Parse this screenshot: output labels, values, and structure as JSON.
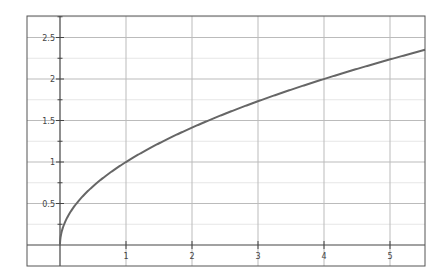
{
  "chart_data": {
    "type": "line",
    "title": "",
    "xlabel": "",
    "ylabel": "",
    "function": "y = sqrt(x)",
    "xlim": [
      -0.5,
      5.5
    ],
    "ylim": [
      -0.25,
      2.75
    ],
    "x_ticks": [
      1,
      2,
      3,
      4,
      5
    ],
    "x_tick_labels": [
      "1",
      "2",
      "3",
      "4",
      "5"
    ],
    "y_ticks": [
      0.5,
      1,
      1.5,
      2,
      2.5
    ],
    "y_tick_labels": [
      "0.5",
      "1",
      "1.5",
      "2",
      "2.5"
    ],
    "y_minor_step": 0.25,
    "grid": true,
    "series": [
      {
        "name": "sqrt(x)",
        "color": "#666666",
        "x": [
          0,
          0.01,
          0.05,
          0.1,
          0.25,
          0.5,
          1,
          1.5,
          2,
          2.5,
          3,
          3.5,
          4,
          4.5,
          5,
          5.5
        ],
        "y": [
          0,
          0.1,
          0.224,
          0.316,
          0.5,
          0.707,
          1,
          1.225,
          1.414,
          1.581,
          1.732,
          1.871,
          2,
          2.121,
          2.236,
          2.345
        ]
      }
    ]
  },
  "colors": {
    "frame": "#555555",
    "axis": "#444444",
    "grid_major": "#bbbbbb",
    "grid_minor": "#e6e6e6",
    "curve": "#666666"
  }
}
